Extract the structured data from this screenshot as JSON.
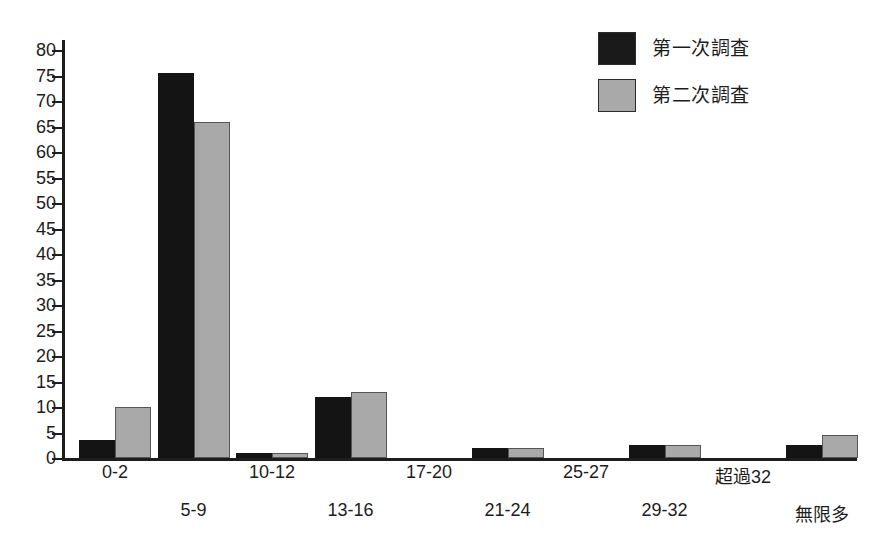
{
  "chart_data": {
    "type": "bar",
    "title": "",
    "subtitle": "",
    "xlabel": "",
    "ylabel": "",
    "ylim": [
      0,
      82
    ],
    "grid": false,
    "legend_position": "top-right",
    "y_ticks": [
      0,
      5,
      10,
      15,
      20,
      25,
      30,
      35,
      40,
      45,
      50,
      55,
      60,
      65,
      70,
      75,
      80
    ],
    "categories": [
      "0-2",
      "5-9",
      "10-12",
      "13-16",
      "17-20",
      "21-24",
      "25-27",
      "29-32",
      "超過32",
      "無限多"
    ],
    "series": [
      {
        "name": "第一次調査",
        "color": "#141414",
        "values": [
          3.5,
          75.5,
          1,
          12,
          0,
          2,
          0,
          2.5,
          0,
          2.5
        ]
      },
      {
        "name": "第二次調査",
        "color": "#a9a9a9",
        "values": [
          10,
          66,
          1,
          13,
          0,
          2,
          0,
          2.5,
          0,
          4.5
        ]
      }
    ]
  },
  "legend": {
    "items": [
      {
        "label": "第一次調査",
        "swatch": "black-swatch"
      },
      {
        "label": "第二次調査",
        "swatch": "gray-swatch"
      }
    ]
  },
  "colors": {
    "series_1": "#141414",
    "series_2": "#a9a9a9",
    "axis": "#1d1d1d",
    "background": "#ffffff"
  }
}
